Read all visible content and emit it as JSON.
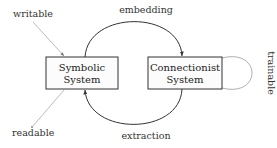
{
  "diagram": {
    "nodes": [
      {
        "id": "symbolic",
        "label_line1": "Symbolic",
        "label_line2": "System"
      },
      {
        "id": "connectionist",
        "label_line1": "Connectionist",
        "label_line2": "System"
      }
    ],
    "edges": [
      {
        "from": "symbolic",
        "to": "connectionist",
        "label": "embedding"
      },
      {
        "from": "connectionist",
        "to": "symbolic",
        "label": "extraction"
      },
      {
        "from": "connectionist",
        "to": "connectionist",
        "label": "trainable"
      }
    ],
    "annotations": {
      "writable": "writable",
      "readable": "readable"
    },
    "colors": {
      "stroke": "#333333",
      "light_stroke": "#aaaaaa",
      "box_fill": "#fcfcfc"
    }
  }
}
